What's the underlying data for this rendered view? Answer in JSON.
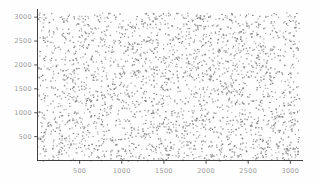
{
  "figure": {
    "background_color": "#fefefe",
    "width": 319,
    "height": 185
  },
  "chart_data": {
    "type": "scatter",
    "title": "",
    "subtitle": "",
    "xlabel": "",
    "ylabel": "",
    "xlim": [
      0,
      3150
    ],
    "ylim": [
      0,
      3150
    ],
    "xticks": [
      500,
      1000,
      1500,
      2000,
      2500,
      3000
    ],
    "yticks": [
      500,
      1000,
      1500,
      2000,
      2500,
      3000
    ],
    "xtick_labels": [
      "500",
      "1000",
      "1500",
      "2000",
      "2500",
      "3000"
    ],
    "ytick_labels": [
      "500",
      "1000",
      "1500",
      "2000",
      "2500",
      "3000"
    ],
    "grid": false,
    "legend": null,
    "annotations": [],
    "spines": {
      "left": true,
      "bottom": true,
      "top": false,
      "right": false
    },
    "marker": {
      "color": "#7c7c7c",
      "size": 1.1,
      "shape": "point",
      "alpha": 1.0
    },
    "n_points": 2600,
    "distribution": "uniform random over x in [0,3100], y in [0,3100]",
    "series": [
      {
        "name": "points",
        "color": "#7c7c7c",
        "x": [],
        "y": []
      }
    ]
  },
  "axes": {
    "tick_color": "#2b2b2b",
    "label_color": "#9a9a9a",
    "axis_color": "#2b2b2b"
  }
}
